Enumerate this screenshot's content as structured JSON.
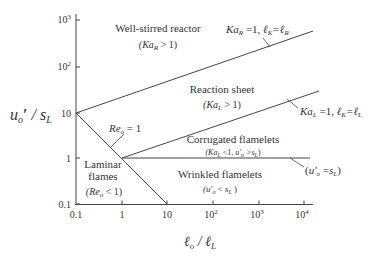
{
  "diagram": {
    "axes": {
      "x": {
        "label": "ℓo / ℓL",
        "scale": "log",
        "ticks": [
          "0.1",
          "1",
          "10",
          "10²",
          "10³",
          "10⁴"
        ]
      },
      "y": {
        "label": "u'o / sL",
        "scale": "log",
        "ticks": [
          "0.1",
          "1",
          "10",
          "10²",
          "10³"
        ]
      }
    },
    "regions": [
      {
        "name": "Well-stirred reactor",
        "condition": "(KaR > 1)"
      },
      {
        "name": "Reaction sheet",
        "condition": "(KaL > 1)"
      },
      {
        "name": "Corrugated flamelets",
        "condition": "(KaL < 1,  u'o > sL)"
      },
      {
        "name": "Wrinkled flamelets",
        "condition": "(u'o < sL)"
      },
      {
        "name": "Laminar flames",
        "name_line1": "Laminar",
        "name_line2": "flames",
        "condition": "(Reo < 1)"
      }
    ],
    "boundaries": [
      {
        "label": "KaR =1,  ℓK=ℓR"
      },
      {
        "label": "KaL =1,  ℓK=ℓL"
      },
      {
        "label": "(u'o =sL)"
      },
      {
        "label": "Reo = 1"
      }
    ]
  }
}
